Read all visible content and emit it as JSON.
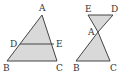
{
  "figures": [
    {
      "name": "triangle-with-parallel-segment",
      "fill": "#d9d9d9",
      "stroke": "#444444",
      "labels": {
        "A": "A",
        "B": "B",
        "C": "C",
        "D": "D",
        "E": "E"
      }
    },
    {
      "name": "bowtie-triangles",
      "fill": "#d9d9d9",
      "stroke": "#444444",
      "labels": {
        "A": "A",
        "B": "B",
        "C": "C",
        "D": "D",
        "E": "E"
      }
    }
  ]
}
